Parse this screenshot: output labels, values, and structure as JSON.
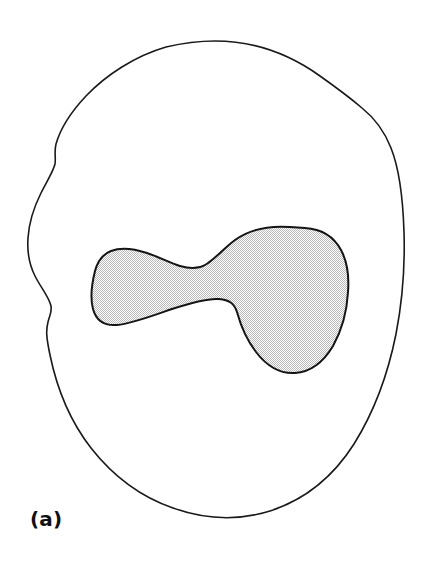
{
  "figure": {
    "panel_label": "(a)",
    "background_color": "#ffffff",
    "outline_color": "#1a1a1a",
    "outline_width": 1.6,
    "inner_fill_color": "#d9d9d9",
    "inner_fill_pattern": "fine-checker-halftone",
    "inner_outline_color": "#141414",
    "inner_outline_width": 2.0,
    "canvas": {
      "width": 426,
      "height": 569
    },
    "shapes": [
      {
        "name": "outer-boundary",
        "role": "outer closed contour, unfilled",
        "filled": false,
        "bbox": {
          "x": 27,
          "y": 40,
          "width": 377,
          "height": 478
        },
        "path": "M 215 41 C 258 41 292 56 320 76 C 344 93 355 102 362 108 C 372 116 384 130 391 148 C 399 168 403 200 404 232 C 405 264 403 298 396 334 C 388 374 374 412 354 444 C 333 477 304 500 270 511 C 238 521 204 519 173 508 C 141 497 113 476 91 448 C 70 421 57 389 50 355 C 46 336 46 330 48 322 C 50 314 52 312 51 306 C 49 297 41 288 35 276 C 29 264 27 252 28 238 C 29 222 34 207 41 193 C 47 181 53 172 55 164 C 56 158 54 152 56 144 C 60 130 70 113 86 96 C 106 75 135 56 166 47 C 183 43 199 41 215 41 Z"
      },
      {
        "name": "inner-shaded-region",
        "role": "inner closed contour, halftone filled",
        "filled": true,
        "bbox": {
          "x": 91,
          "y": 227,
          "width": 258,
          "height": 147
        },
        "path": "M 305 228 C 322 229 334 237 341 250 C 348 263 349 279 348 292 C 347 310 342 330 333 346 C 324 361 311 372 295 373 C 279 374 266 365 256 352 C 246 339 240 323 237 312 C 234 303 229 300 219 299 C 207 298 190 303 172 309 C 152 316 131 324 117 325 C 104 326 96 320 93 309 C 90 298 92 283 95 271 C 98 260 103 254 111 251 C 121 247 135 249 147 253 C 159 257 170 263 180 266 C 190 269 198 269 205 265 C 214 260 223 249 235 240 C 253 227 276 226 290 227 Z"
      }
    ]
  }
}
